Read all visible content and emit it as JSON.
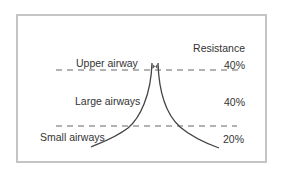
{
  "diagram": {
    "title_header": "Resistance",
    "regions": [
      {
        "label": "Upper airway",
        "resistance": "40%"
      },
      {
        "label": "Large airways",
        "resistance": "40%"
      },
      {
        "label": "Small airways",
        "resistance": "20%"
      }
    ],
    "colors": {
      "frame_border": "#c4c4c4",
      "curve": "#444444",
      "dashed_line": "#666666",
      "text": "#333333"
    }
  }
}
